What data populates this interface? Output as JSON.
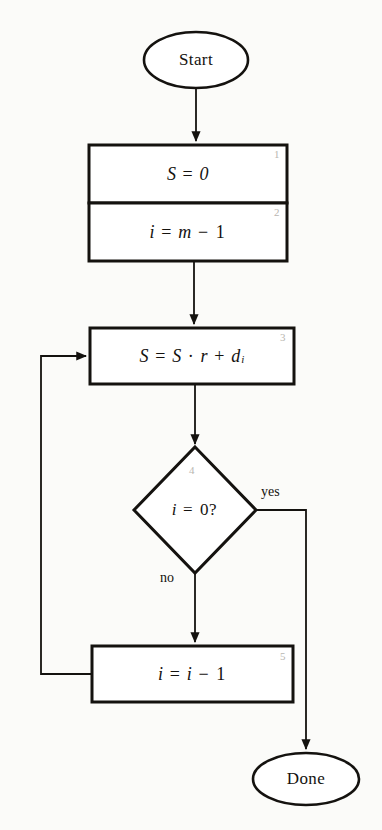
{
  "diagram": {
    "type": "flowchart",
    "colors": {
      "page_background": "#fbfbf9",
      "stroke": "#14120f",
      "node_fill": "#ffffff",
      "step_number": "#b9b6b0"
    },
    "nodes": [
      {
        "id": "start",
        "shape": "ellipse",
        "label": "Start",
        "step": ""
      },
      {
        "id": "init_s",
        "shape": "process",
        "label": "S = 0",
        "step": "1"
      },
      {
        "id": "init_i",
        "shape": "process",
        "label": "i = m − 1",
        "step": "2"
      },
      {
        "id": "accumulate",
        "shape": "process",
        "label": "S = S · r + dᵢ",
        "step": "3"
      },
      {
        "id": "test_i",
        "shape": "decision",
        "label": "i = 0?",
        "step": "4"
      },
      {
        "id": "decrement",
        "shape": "process",
        "label": "i = i − 1",
        "step": "5"
      },
      {
        "id": "done",
        "shape": "ellipse",
        "label": "Done",
        "step": ""
      }
    ],
    "edges": [
      {
        "from": "start",
        "to": "init_s",
        "label": ""
      },
      {
        "from": "init_i",
        "to": "accumulate",
        "label": ""
      },
      {
        "from": "accumulate",
        "to": "test_i",
        "label": ""
      },
      {
        "from": "test_i",
        "to": "done",
        "label": "yes"
      },
      {
        "from": "test_i",
        "to": "decrement",
        "label": "no"
      },
      {
        "from": "decrement",
        "to": "accumulate",
        "label": ""
      }
    ],
    "edge_labels": {
      "yes": "yes",
      "no": "no"
    }
  }
}
